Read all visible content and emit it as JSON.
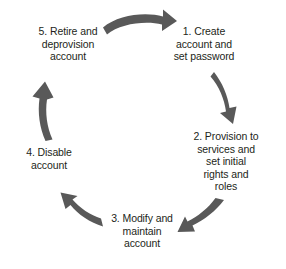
{
  "diagram": {
    "type": "cycle",
    "arrow_color": "#595959",
    "text_color": "#231f20",
    "background_color": "#ffffff",
    "stages": [
      {
        "number": "1.",
        "label": "1. Create\naccount and\nset password",
        "position": "right-top",
        "arrow_out": "arrow-1-to-2"
      },
      {
        "number": "2.",
        "label": "2. Provision to\nservices and\nset initial\nrights and\nroles",
        "position": "right-bottom",
        "arrow_out": "arrow-2-to-3"
      },
      {
        "number": "3.",
        "label": "3. Modify and\nmaintain\naccount",
        "position": "bottom",
        "arrow_out": "arrow-3-to-4"
      },
      {
        "number": "4.",
        "label": "4. Disable\naccount",
        "position": "left-bottom",
        "arrow_out": "arrow-4-to-5"
      },
      {
        "number": "5.",
        "label": "5. Retire and\ndeprovision\naccount",
        "position": "left-top",
        "arrow_out": "arrow-5-to-1"
      }
    ],
    "arrows": [
      {
        "name": "arrow-5-to-1",
        "direction": "right",
        "from": "5",
        "to": "1"
      },
      {
        "name": "arrow-1-to-2",
        "direction": "down",
        "from": "1",
        "to": "2"
      },
      {
        "name": "arrow-2-to-3",
        "direction": "down-left",
        "from": "2",
        "to": "3"
      },
      {
        "name": "arrow-3-to-4",
        "direction": "up-left",
        "from": "3",
        "to": "4"
      },
      {
        "name": "arrow-4-to-5",
        "direction": "up",
        "from": "4",
        "to": "5"
      }
    ]
  }
}
